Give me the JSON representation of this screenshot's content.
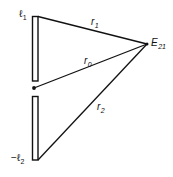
{
  "diagram": {
    "type": "geometry-figure",
    "stroke_color": "#111111",
    "background": "#ffffff",
    "elements": {
      "upper_plate": {
        "x": 32,
        "y": 16,
        "width": 6,
        "height": 65
      },
      "lower_plate": {
        "x": 32,
        "y": 96,
        "width": 6,
        "height": 64
      },
      "origin_dot": {
        "cx": 34,
        "cy": 88,
        "r": 1.8
      },
      "field_point": {
        "cx": 147,
        "cy": 44,
        "r": 1.6
      },
      "lines": [
        {
          "id": "r1",
          "x1": 38,
          "y1": 16,
          "x2": 147,
          "y2": 44
        },
        {
          "id": "r0",
          "x1": 34,
          "y1": 88,
          "x2": 147,
          "y2": 44
        },
        {
          "id": "r2",
          "x1": 38,
          "y1": 160,
          "x2": 147,
          "y2": 44
        }
      ]
    },
    "labels": {
      "l1": {
        "main": "ℓ",
        "sub": "1"
      },
      "minus_l2": {
        "main": "−ℓ",
        "sub": "2"
      },
      "r1": {
        "main": "r",
        "sub": "1"
      },
      "r0": {
        "main": "r",
        "sub": "0"
      },
      "r2": {
        "main": "r",
        "sub": "2"
      },
      "E21": {
        "main": "E",
        "sub": "21"
      }
    }
  }
}
